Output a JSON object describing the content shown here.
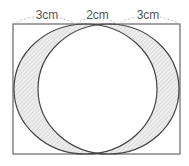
{
  "diagram": {
    "labels": {
      "left": "3cm",
      "middle": "2cm",
      "right": "3cm"
    },
    "colors": {
      "stroke": "#444444",
      "rect_stroke": "#666666",
      "hatch": "#bbbbbb",
      "dashed": "#aaaaaa",
      "label": "#555555"
    },
    "shapes": {
      "rectangle": {
        "x": 13,
        "y": 24,
        "width": 167,
        "height": 130
      },
      "left_circle": {
        "cx": 85.5,
        "cy": 89,
        "rx": 71.5,
        "ry": 65
      },
      "right_circle": {
        "cx": 108.5,
        "cy": 89,
        "rx": 70.5,
        "ry": 65
      }
    }
  }
}
